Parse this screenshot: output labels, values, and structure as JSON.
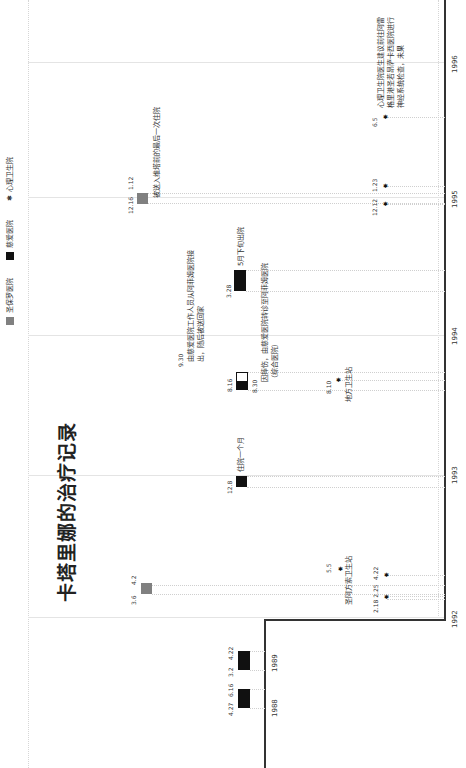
{
  "title": "卡塔里娜的治疗记录",
  "legend": [
    {
      "label": "圣保罗医院",
      "symbol": "gray-square",
      "color": "#808080"
    },
    {
      "label": "慈爱医院",
      "symbol": "black-square",
      "color": "#111111"
    },
    {
      "label": "心理卫生院",
      "symbol": "asterisk",
      "glyph": "✱"
    }
  ],
  "years": [
    "1988",
    "1989",
    "1992",
    "1993",
    "1994",
    "1995",
    "1996"
  ],
  "events": {
    "e1988": {
      "start": "4.27",
      "end": "6.16",
      "hospital": "慈爱医院"
    },
    "e1989": {
      "start": "3.2",
      "end": "4.22",
      "hospital": "慈爱医院"
    },
    "e1992a": {
      "start": "3.6",
      "end": "4.2",
      "hospital": "圣保罗医院"
    },
    "e1992b": {
      "dates": "2.18  2.25",
      "date2": "4.22",
      "hospital": "心理卫生院"
    },
    "e1992c": {
      "date": "5.5",
      "note": "圣阿方索卫生站"
    },
    "e1993": {
      "date": "12.8",
      "note": "住院一个月",
      "hospital": "慈爱医院"
    },
    "e1994a": {
      "date": "8.16",
      "hospital": "慈爱医院"
    },
    "e1994b": {
      "date": "8.30",
      "note": "因摔伤，由慈爱医院转诊至阿菲姆医院（综合医院）"
    },
    "e1994c": {
      "date": "9.30",
      "note": "由慈爱医院工作人员从阿菲姆医院接出，随后被送回家"
    },
    "e1994d": {
      "date": "8.10",
      "note": "地方卫生站"
    },
    "e1995a": {
      "start": "3.28",
      "note": "5月下旬出院",
      "hospital": "慈爱医院"
    },
    "e1995b": {
      "start": "12.16",
      "end": "1.12",
      "note": "被送入维塔前的最后一次住院",
      "hospital": "圣保罗医院"
    },
    "e1995c": {
      "date1": "12.12",
      "date2": "1.23",
      "hospital": "心理卫生院"
    },
    "e1996": {
      "date": "6.5",
      "note": "心理卫生院医生建议前往阿雷格里港圣若昂萨卡西医院进行神经系统检查，未果",
      "hospital": "心理卫生院"
    }
  }
}
